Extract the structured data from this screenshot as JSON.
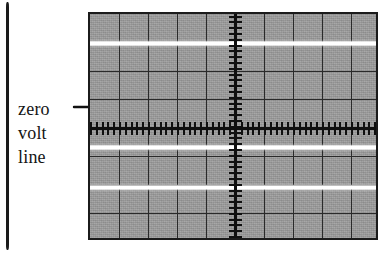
{
  "figure": {
    "kind": "oscilloscope-graticule-illustration",
    "background_color": "#ffffff"
  },
  "callout": {
    "lines": [
      "zero",
      "volt",
      "line"
    ],
    "text": "zero volt line",
    "leader": {
      "style": "straight-then-curved-with-arrowhead",
      "points_to": "zero-volt-line"
    }
  },
  "scope": {
    "screen_color": "#9b9b9b",
    "grid_line_color": "#2a2a2a",
    "axis_color": "#101010",
    "trace_color": "#ffffff",
    "border_color": "#1b1b1b",
    "divisions_horizontal": 10,
    "divisions_vertical": 8,
    "tick_marks_per_division": 5,
    "screen": {
      "left": 88,
      "top": 12,
      "width": 290,
      "height": 228
    },
    "grid": {
      "vertical_lines_x": [
        29,
        58,
        87,
        116,
        174,
        203,
        232,
        261
      ],
      "horizontal_lines_y": [
        28.5,
        57,
        85.5,
        142.5,
        171,
        199.5
      ],
      "center_axis_x": 145,
      "center_axis_y": 114
    },
    "traces": [
      {
        "name": "trace-upper",
        "y": 27,
        "label": "positive peak level"
      },
      {
        "name": "trace-middle",
        "y": 131,
        "label": "negative level below zero volt line"
      },
      {
        "name": "trace-lower",
        "y": 171,
        "label": "lower negative level"
      }
    ]
  }
}
